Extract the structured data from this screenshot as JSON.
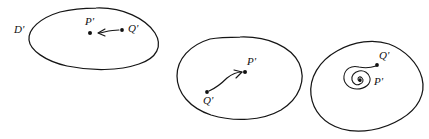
{
  "figure": {
    "background_color": "#ffffff",
    "ink_color": "#151515",
    "width": 429,
    "height": 139,
    "style": "hand-drawn line figure",
    "panels": [
      {
        "id": "panel-1",
        "name": "region-constant-translation",
        "region_label": "D'",
        "point_labels": {
          "source": "Q'",
          "target": "P'"
        },
        "arrow_direction": "leftward",
        "trajectory_type": "straight-short",
        "points": [
          {
            "label": "P'",
            "x": 90,
            "y": 33
          },
          {
            "label": "Q'",
            "x": 123,
            "y": 30
          }
        ]
      },
      {
        "id": "panel-2",
        "name": "region-curved-flow",
        "region_label": "",
        "point_labels": {
          "source": "Q'",
          "target": "P'"
        },
        "arrow_direction": "up-right",
        "trajectory_type": "curved-arc",
        "points": [
          {
            "label": "Q'",
            "x": 207,
            "y": 92
          },
          {
            "label": "P'",
            "x": 245,
            "y": 72
          }
        ]
      },
      {
        "id": "panel-3",
        "name": "region-spiral-sink",
        "region_label": "",
        "point_labels": {
          "source": "Q'",
          "target": "P'"
        },
        "arrow_direction": "inward-spiral",
        "trajectory_type": "spiral",
        "points": [
          {
            "label": "Q'",
            "x": 377,
            "y": 64
          },
          {
            "label": "P'",
            "x": 362,
            "y": 82
          }
        ]
      }
    ],
    "labels": {
      "d_prime": "D'",
      "p_prime": "P'",
      "q_prime": "Q'"
    }
  }
}
